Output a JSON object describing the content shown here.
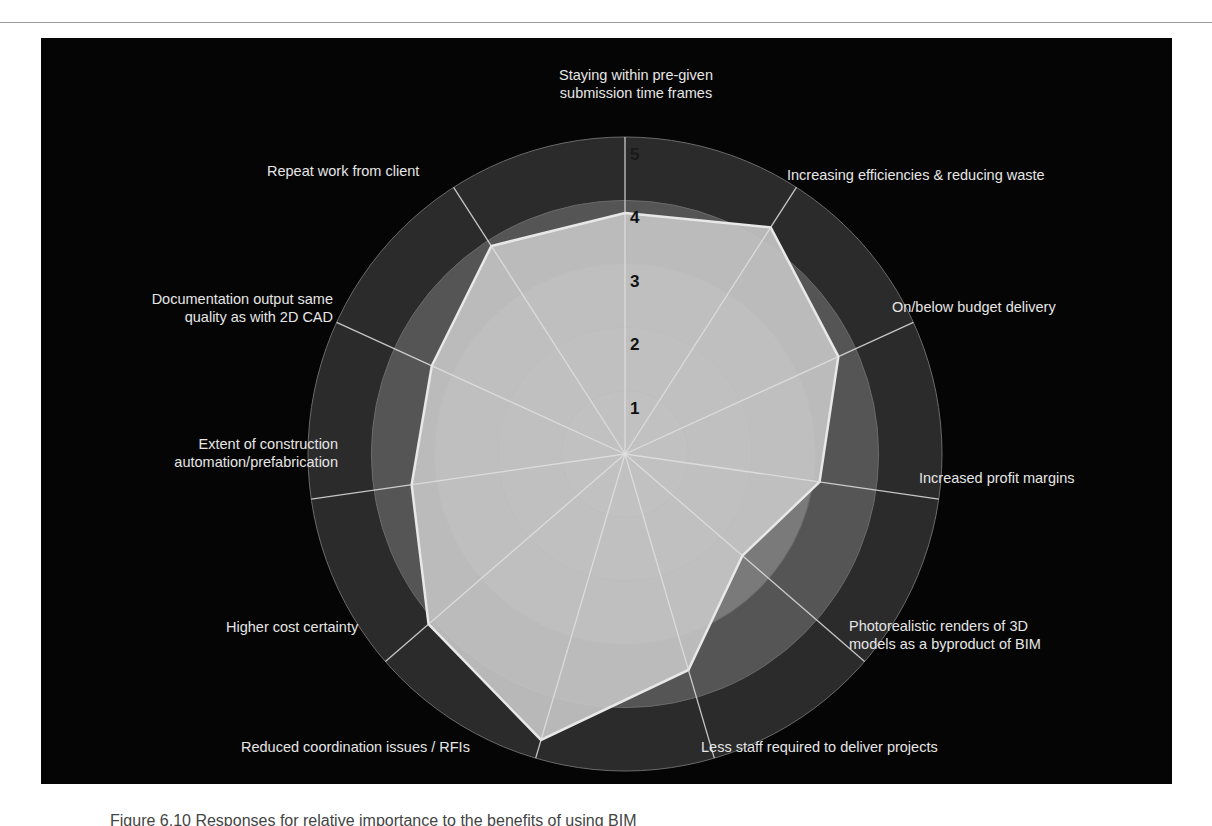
{
  "chart_data": {
    "type": "radar",
    "title": "",
    "categories": [
      "Staying within pre-given submission time frames",
      "Increasing efficiencies & reducing waste",
      "On/below budget delivery",
      "Increased profit margins",
      "Photorealistic renders of 3D models as a byproduct of BIM",
      "Less staff required to deliver projects",
      "Reduced coordination issues / RFIs",
      "Higher cost certainty",
      "Extent of construction automation/prefabrication",
      "Documentation output same quality as with 2D CAD",
      "Repeat work from client"
    ],
    "series": [
      {
        "name": "Rating",
        "values": [
          3.8,
          4.25,
          3.7,
          3.1,
          2.45,
          3.55,
          4.7,
          4.1,
          3.4,
          3.35,
          3.9
        ]
      }
    ],
    "rlim": [
      0,
      5
    ],
    "ticks": [
      "1",
      "2",
      "3",
      "4",
      "5"
    ],
    "grid": true,
    "legend": "none"
  },
  "labels": {
    "top": [
      "Staying within pre-given",
      "submission time frames"
    ],
    "efficiency": [
      "Increasing efficiencies & reducing waste"
    ],
    "budget": [
      "On/below budget delivery"
    ],
    "profit": [
      "Increased profit margins"
    ],
    "photo": [
      "Photorealistic renders of 3D",
      "models as a byproduct of BIM"
    ],
    "staff": [
      "Less staff required to deliver projects"
    ],
    "coordination": [
      "Reduced coordination issues / RFIs"
    ],
    "cost": [
      "Higher cost certainty"
    ],
    "construction": [
      "Extent of construction",
      "automation/prefabrication"
    ],
    "documentation": [
      "Documentation output same",
      "quality as with 2D CAD"
    ],
    "repeat": [
      "Repeat work from client"
    ]
  },
  "colors": {
    "panel": "#050505",
    "ring_outer": "#2a2a2a",
    "ring_mid": "#555555",
    "ring_inner": "#8a8a8a",
    "polygon_fill": "#c4c4c4",
    "polygon_stroke": "#e8e8e8",
    "spoke": "#e0e0e0",
    "label": "#e6e6e6"
  },
  "caption": "Figure 6.10 Responses for relative importance to the benefits of using BIM"
}
